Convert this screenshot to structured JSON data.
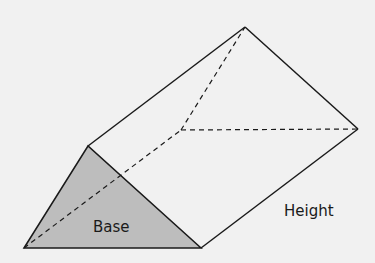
{
  "diagram": {
    "labels": {
      "base": "Base",
      "height": "Height"
    },
    "colors": {
      "background": "#f1f1f1",
      "base_fill": "#bdbdbd",
      "stroke": "#1a1a1a"
    }
  }
}
